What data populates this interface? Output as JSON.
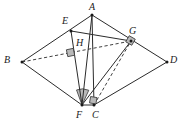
{
  "figure": {
    "type": "euclidean-geometry-diagram",
    "width": 184,
    "height": 128,
    "background_color": "#ffffff",
    "stroke_color": "#2b2b2b",
    "mark_fill_color": "#b9b9b9",
    "mark_stroke_color": "#3a3a3a"
  },
  "points": [
    {
      "id": "A",
      "label": "A",
      "x": 92,
      "y": 15,
      "label_x": 89,
      "label_y": 2
    },
    {
      "id": "B",
      "label": "B",
      "x": 22,
      "y": 62,
      "label_x": 4,
      "label_y": 55
    },
    {
      "id": "C",
      "label": "C",
      "x": 94,
      "y": 105,
      "label_x": 92,
      "label_y": 110
    },
    {
      "id": "D",
      "label": "D",
      "x": 167,
      "y": 62,
      "label_x": 170,
      "label_y": 55
    },
    {
      "id": "E",
      "label": "E",
      "x": 71,
      "y": 31,
      "label_x": 62,
      "label_y": 16
    },
    {
      "id": "F",
      "label": "F",
      "x": 82,
      "y": 105,
      "label_x": 76,
      "label_y": 110
    },
    {
      "id": "G",
      "label": "G",
      "x": 131,
      "y": 41,
      "label_x": 129,
      "label_y": 26
    },
    {
      "id": "H",
      "label": "H",
      "x": 73,
      "y": 49,
      "label_x": 76,
      "label_y": 38
    }
  ],
  "segments": [
    {
      "id": "AB",
      "from": "A",
      "to": "B",
      "style": "solid"
    },
    {
      "id": "AD",
      "from": "A",
      "to": "D",
      "style": "solid"
    },
    {
      "id": "AC",
      "from": "A",
      "to": "C",
      "style": "solid"
    },
    {
      "id": "AF",
      "from": "A",
      "to": "F",
      "style": "solid"
    },
    {
      "id": "BF",
      "from": "B",
      "to": "F",
      "style": "solid"
    },
    {
      "id": "FC",
      "from": "F",
      "to": "C",
      "style": "solid"
    },
    {
      "id": "CD",
      "from": "C",
      "to": "D",
      "style": "solid"
    },
    {
      "id": "EG",
      "from": "E",
      "to": "G",
      "style": "solid"
    },
    {
      "id": "EF",
      "from": "E",
      "to": "F",
      "style": "solid"
    },
    {
      "id": "FG",
      "from": "F",
      "to": "G",
      "style": "solid"
    },
    {
      "id": "BG",
      "from": "B",
      "to": "G",
      "style": "dashed"
    },
    {
      "id": "CG",
      "from": "C",
      "to": "G",
      "style": "dashed"
    }
  ],
  "right_angle_marks": [
    {
      "id": "right-angle-h",
      "at": "H",
      "x": 70,
      "y": 52,
      "size": 7,
      "rotate": -12
    },
    {
      "id": "right-angle-g",
      "at": "G",
      "x": 128,
      "y": 38,
      "size": 7,
      "rotate": 30
    },
    {
      "id": "right-angle-c",
      "at": "C",
      "x": 91,
      "y": 97,
      "size": 7,
      "rotate": 10
    }
  ],
  "angle_marks": [
    {
      "id": "shaded-angle-f",
      "at": "F",
      "x": 82,
      "y": 105,
      "radius": 16,
      "start_deg": 250,
      "end_deg": 295
    }
  ],
  "labels_order": [
    "A",
    "E",
    "G",
    "H",
    "B",
    "D",
    "F",
    "C"
  ]
}
